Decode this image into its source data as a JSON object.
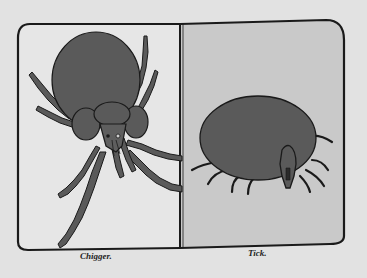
{
  "illustration": {
    "panels": [
      {
        "label": "Chigger.",
        "background": "#e6e6e6",
        "subject": "chigger"
      },
      {
        "label": "Tick.",
        "background": "#c9c9c9",
        "subject": "tick"
      }
    ],
    "colors": {
      "page": "#e2e2e2",
      "ink": "#1a1a1a",
      "body_fill": "#5a5a5a"
    }
  }
}
